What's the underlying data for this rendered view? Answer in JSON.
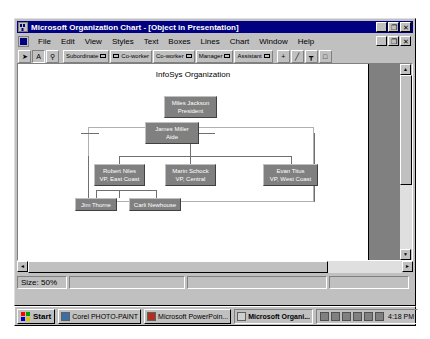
{
  "window": {
    "title": "Microsoft Organization Chart - [Object in Presentation]",
    "icon": "org-chart-icon",
    "controls": {
      "minimize": "_",
      "restore": "❐",
      "close": "✕"
    }
  },
  "menu": {
    "items": [
      {
        "label": "File"
      },
      {
        "label": "Edit"
      },
      {
        "label": "View"
      },
      {
        "label": "Styles"
      },
      {
        "label": "Text"
      },
      {
        "label": "Boxes"
      },
      {
        "label": "Lines"
      },
      {
        "label": "Chart"
      },
      {
        "label": "Window"
      },
      {
        "label": "Help"
      }
    ],
    "doc_controls": {
      "minimize": "_",
      "restore": "❐",
      "close": "✕"
    }
  },
  "toolbar": {
    "buttons": [
      {
        "name": "select-arrow-tool",
        "label": "",
        "glyph": "➤",
        "pressed": false
      },
      {
        "name": "text-tool",
        "label": "",
        "glyph": "A",
        "pressed": true
      },
      {
        "name": "zoom-tool",
        "label": "",
        "glyph": "⚲",
        "pressed": false
      },
      {
        "name": "subordinate-tool",
        "label": "Subordinate",
        "glyph": "",
        "pressed": false
      },
      {
        "name": "left-coworker-tool",
        "label": "Co-worker",
        "glyph": "",
        "pressed": false
      },
      {
        "name": "right-coworker-tool",
        "label": "Co-worker",
        "glyph": "",
        "pressed": false
      },
      {
        "name": "manager-tool",
        "label": "Manager",
        "glyph": "",
        "pressed": false
      },
      {
        "name": "assistant-tool",
        "label": "Assistant",
        "glyph": "",
        "pressed": false
      },
      {
        "name": "add-box-tool",
        "label": "",
        "glyph": "+",
        "pressed": false
      },
      {
        "name": "line-tool",
        "label": "",
        "glyph": "╱",
        "pressed": false
      },
      {
        "name": "connector-tool",
        "label": "",
        "glyph": "┳",
        "pressed": false
      },
      {
        "name": "box-tool",
        "label": "",
        "glyph": "□",
        "pressed": false
      }
    ]
  },
  "chart": {
    "title": "InfoSys Organization",
    "boxes": [
      {
        "name": "president",
        "person": "Miles Jackson",
        "title": "President"
      },
      {
        "name": "aide",
        "person": "James Miller",
        "title": "Aide"
      },
      {
        "name": "vp-east",
        "person": "Robert Niles",
        "title": "VP, East Coast"
      },
      {
        "name": "vp-central",
        "person": "Marin Schock",
        "title": "VP, Central"
      },
      {
        "name": "vp-west",
        "person": "Evan Titus",
        "title": "VP, West Coast"
      },
      {
        "name": "staff-1",
        "person": "Jim Thorne",
        "title": ""
      },
      {
        "name": "staff-2",
        "person": "Carli Newhouse",
        "title": ""
      }
    ],
    "colors": {
      "box_fill": "#808080",
      "box_text": "#ffffff",
      "connector": "#707070",
      "page_background": "#ffffff",
      "canvas_background": "#808080"
    }
  },
  "statusbar": {
    "size_label": "Size: 50%",
    "panel2": "",
    "panel3": "",
    "panel4": ""
  },
  "scrollbars": {
    "vertical": {
      "up": "▲",
      "down": "▼"
    },
    "horizontal": {
      "left": "◄",
      "right": "►"
    }
  },
  "taskbar": {
    "start_label": "Start",
    "tasks": [
      {
        "name": "taskbar-item-photopaint",
        "label": "Corel PHOTO-PAINT",
        "icon": "photopaint-icon",
        "active": false
      },
      {
        "name": "taskbar-item-powerpoint",
        "label": "Microsoft PowerPoin...",
        "icon": "powerpoint-icon",
        "active": false
      },
      {
        "name": "taskbar-item-orgchart",
        "label": "Microsoft Organi...",
        "icon": "orgchart-icon",
        "active": true
      }
    ],
    "tray_icons": [
      "speaker-icon",
      "network-icon",
      "display-icon",
      "printer-icon",
      "modem-icon",
      "scheduler-icon"
    ],
    "clock": "4:18 PM"
  }
}
